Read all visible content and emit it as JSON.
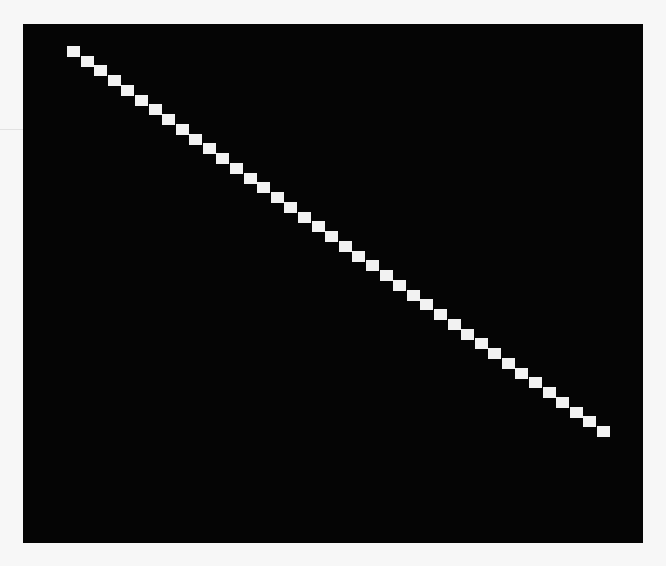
{
  "image": {
    "description": "Black rectangular field with a diagonal staircase line of white square blocks running from top-left to bottom-right",
    "colors": {
      "background": "#f7f7f7",
      "field": "#050505",
      "blocks": "#f2f2f2"
    },
    "diagonal": {
      "block_count": 40,
      "direction": "top-left to bottom-right"
    }
  }
}
